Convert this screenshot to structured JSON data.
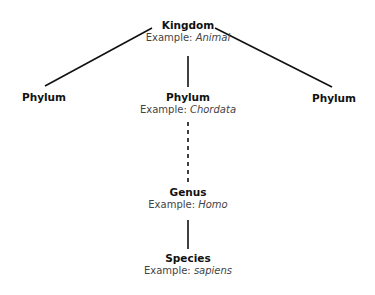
{
  "diagram": {
    "type": "taxonomy-hierarchy",
    "nodes": {
      "kingdom": {
        "title": "Kingdom",
        "example_prefix": "Example: ",
        "example_value": "Animal"
      },
      "phylum_left": {
        "title": "Phylum"
      },
      "phylum_center": {
        "title": "Phylum",
        "example_prefix": "Example: ",
        "example_value": "Chordata"
      },
      "phylum_right": {
        "title": "Phylum"
      },
      "genus": {
        "title": "Genus",
        "example_prefix": "Example: ",
        "example_value": "Homo"
      },
      "species": {
        "title": "Species",
        "example_prefix": "Example: ",
        "example_value": "sapiens"
      }
    },
    "edges": [
      {
        "from": "kingdom",
        "to": "phylum_left",
        "style": "solid"
      },
      {
        "from": "kingdom",
        "to": "phylum_center",
        "style": "solid"
      },
      {
        "from": "kingdom",
        "to": "phylum_right",
        "style": "solid"
      },
      {
        "from": "phylum_center",
        "to": "genus",
        "style": "dashed"
      },
      {
        "from": "genus",
        "to": "species",
        "style": "solid"
      }
    ],
    "colors": {
      "line": "#111111",
      "title": "#111111",
      "example": "#444444",
      "background": "#ffffff"
    }
  }
}
